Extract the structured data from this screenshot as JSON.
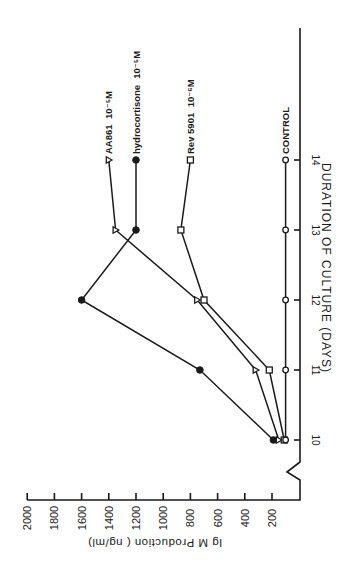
{
  "chart_data": {
    "type": "line",
    "orientation": "rotated 90deg counter-clockwise (value axis runs horizontally at bottom, days run vertically)",
    "title": "",
    "xlabel": "DURATION OF CULTURE (DAYS)",
    "ylabel": "Ig M Production ( ng/ml)",
    "x": [
      10,
      11,
      12,
      13,
      14
    ],
    "x_tick_labels": [
      "10",
      "11",
      "12",
      "13",
      "14"
    ],
    "y_ticks": [
      200,
      400,
      600,
      800,
      1000,
      1200,
      1400,
      1600,
      1800,
      2000
    ],
    "y_tick_labels": [
      "200",
      "400",
      "600",
      "800",
      "1000",
      "1200",
      "1400",
      "1600",
      "1800",
      "2000"
    ],
    "ylim": [
      0,
      2000
    ],
    "axis_break": true,
    "grid": false,
    "series": [
      {
        "name": "AA861 10⁻⁵M",
        "label_main": "AA861",
        "label_conc": "10⁻⁵M",
        "marker": "open-triangle",
        "values": [
          150,
          320,
          750,
          1350,
          1400
        ]
      },
      {
        "name": "hydrocortisone 10⁻⁵M",
        "label_main": "hydrocortisone",
        "label_conc": "10⁻⁵M",
        "marker": "filled-circle",
        "values": [
          190,
          730,
          1600,
          1200,
          1200
        ]
      },
      {
        "name": "Rev 5901 10⁻⁶M",
        "label_main": "Rev 5901",
        "label_conc": "10⁻⁶M",
        "marker": "open-square",
        "values": [
          110,
          220,
          700,
          870,
          800
        ]
      },
      {
        "name": "CONTROL",
        "label_main": "CONTROL",
        "label_conc": "",
        "marker": "open-circle",
        "values": [
          100,
          100,
          100,
          100,
          100
        ]
      }
    ],
    "legend_position": "inline labels at end of each line (day 14)"
  }
}
